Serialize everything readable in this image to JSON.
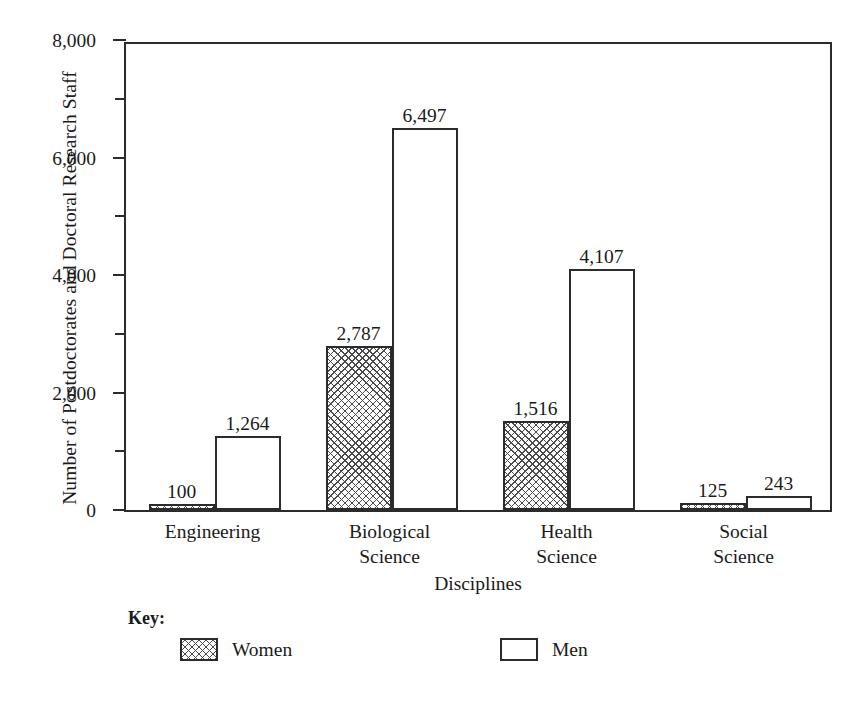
{
  "chart_data": {
    "type": "bar",
    "title": "",
    "xlabel": "Disciplines",
    "ylabel": "Number of Postdoctorates and Doctoral Research Staff",
    "ylim": [
      0,
      8000
    ],
    "ytick_labels": [
      "0",
      "2,000",
      "4,000",
      "6,000",
      "8,000"
    ],
    "ytick_values": [
      0,
      2000,
      4000,
      6000,
      8000
    ],
    "minor_tick_values": [
      1000,
      3000,
      5000,
      7000
    ],
    "grid": false,
    "legend_position": "below-left",
    "categories": [
      "Engineering",
      "Biological Science",
      "Health Science",
      "Social Science"
    ],
    "category_lines": [
      [
        "Engineering"
      ],
      [
        "Biological",
        "Science"
      ],
      [
        "Health",
        "Science"
      ],
      [
        "Social",
        "Science"
      ]
    ],
    "series": [
      {
        "name": "Women",
        "fill": "cross-hatch",
        "values": [
          100,
          2787,
          1516,
          125
        ],
        "value_labels": [
          "100",
          "2,787",
          "1,516",
          "125"
        ]
      },
      {
        "name": "Men",
        "fill": "white",
        "values": [
          1264,
          6497,
          4107,
          243
        ],
        "value_labels": [
          "1,264",
          "6,497",
          "4,107",
          "243"
        ]
      }
    ]
  },
  "legend": {
    "title": "Key:",
    "entries": [
      {
        "label": "Women",
        "swatch": "cross-hatch-swatch"
      },
      {
        "label": "Men",
        "swatch": "white-swatch"
      }
    ]
  },
  "colors": {
    "ink": "#2b2b2b",
    "background": "#ffffff",
    "hatch": "#4a4a4a"
  }
}
